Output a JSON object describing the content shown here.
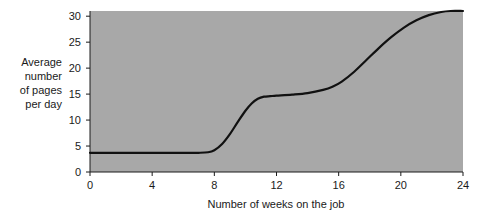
{
  "chart_data": {
    "type": "line",
    "title": "",
    "subtitle": "",
    "xlabel": "Number of weeks on the job",
    "ylabel": "Average number of pages per day",
    "ylabel_lines": [
      "Average",
      "number",
      "of pages",
      "per day"
    ],
    "xlim": [
      0,
      24
    ],
    "ylim": [
      0,
      31
    ],
    "xticks": [
      0,
      4,
      8,
      12,
      16,
      20,
      24
    ],
    "xtick_labels": [
      "0",
      "4",
      "8",
      "12",
      "16",
      "20",
      "24"
    ],
    "yticks": [
      0,
      5,
      10,
      15,
      20,
      25,
      30
    ],
    "ytick_labels": [
      "0",
      "5",
      "10",
      "15",
      "20",
      "25",
      "30"
    ],
    "grid": false,
    "legend": false,
    "legend_position": "none",
    "plot_background_color": "#a8a8a8",
    "page_background_color": "#ffffff",
    "line_color": "#111111",
    "series": [
      {
        "name": "Average number of pages per day",
        "x": [
          0,
          1,
          2,
          3,
          4,
          5,
          6,
          7,
          7.6,
          8,
          8.5,
          9,
          9.5,
          10,
          10.4,
          10.8,
          11.2,
          11.6,
          12,
          13,
          14,
          15,
          15.6,
          16.2,
          17,
          17.8,
          18.6,
          19.4,
          20.2,
          21,
          21.8,
          22.6,
          23.2,
          24
        ],
        "values": [
          3.7,
          3.7,
          3.7,
          3.7,
          3.7,
          3.7,
          3.7,
          3.7,
          3.8,
          4.2,
          5.4,
          7.3,
          9.6,
          11.8,
          13.2,
          14.1,
          14.5,
          14.6,
          14.7,
          14.9,
          15.2,
          15.8,
          16.4,
          17.4,
          19.3,
          21.6,
          23.9,
          26.0,
          27.8,
          29.2,
          30.2,
          30.8,
          31.0,
          31.0
        ]
      }
    ],
    "annotations": []
  }
}
